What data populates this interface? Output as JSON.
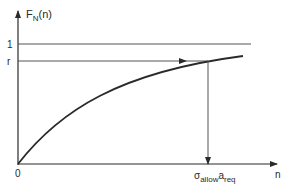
{
  "diagram": {
    "y_axis_label_main": "F",
    "y_axis_label_sub": "N",
    "y_axis_label_arg": "(n)",
    "x_axis_label": "n",
    "origin_label": "0",
    "level_one_label": "1",
    "level_r_label": "r",
    "marker_label_sigma": "σ",
    "marker_label_allow": "allow",
    "marker_label_a": "a",
    "marker_label_req": "req",
    "curve_description": "monotonically increasing concave curve F_N(n) approaching 1",
    "ink_color": "#2a2a2a",
    "thin_line_color": "#555555"
  }
}
